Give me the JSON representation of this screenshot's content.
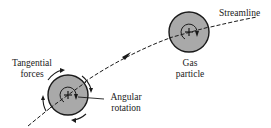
{
  "labels": {
    "tangential_forces_1": "Tangential",
    "tangential_forces_2": "forces",
    "angular_rotation_1": "Angular",
    "angular_rotation_2": "rotation",
    "gas_particle_1": "Gas",
    "gas_particle_2": "particle",
    "streamline": "Streamline"
  },
  "colors": {
    "particle_fill": "#a9a9a9",
    "outline": "#1a1a1a",
    "background": "#ffffff"
  }
}
